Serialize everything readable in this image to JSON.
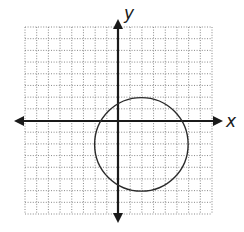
{
  "diagram": {
    "type": "coordinate_plane_with_circle",
    "axes": {
      "x_label": "x",
      "y_label": "y",
      "x_range": [
        -8,
        8
      ],
      "y_range": [
        -8,
        8
      ],
      "grid": true,
      "grid_style": "dotted",
      "arrows": "both-ends"
    },
    "circle": {
      "center": [
        2,
        -2
      ],
      "radius": 4,
      "equation": "(x - 2)^2 + (y + 2)^2 = 16"
    },
    "colors": {
      "axis": "#1a1a1a",
      "grid": "#7a7a7a",
      "circle": "#2a2a2a",
      "background": "#ffffff"
    }
  }
}
